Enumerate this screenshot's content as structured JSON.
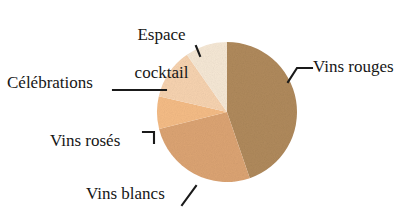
{
  "chart_data": {
    "type": "pie",
    "title": "",
    "subtitle": "",
    "xlabel": "",
    "ylabel": "",
    "grid": false,
    "legend_position": "none",
    "labels_position": "outside-with-leader-lines",
    "center": {
      "x": 227,
      "y": 112
    },
    "radius": 70,
    "start_angle_deg": 0,
    "direction": "clockwise",
    "categories": [
      "Vins rouges",
      "Vins blancs",
      "Vins rosés",
      "Célébrations",
      "Espace cocktail"
    ],
    "values": [
      44.7,
      26.4,
      7.5,
      11.7,
      9.7
    ],
    "value_unit": "percent",
    "slices": [
      {
        "label": "Vins rouges",
        "value": 44.7,
        "color": "#B08A5C",
        "start_deg": 0,
        "end_deg": 161
      },
      {
        "label": "Vins blancs",
        "value": 26.4,
        "color": "#DCA473",
        "start_deg": 161,
        "end_deg": 256
      },
      {
        "label": "Vins rosés",
        "value": 7.5,
        "color": "#F5BC86",
        "start_deg": 256,
        "end_deg": 283
      },
      {
        "label": "Célébrations",
        "value": 11.7,
        "color": "#F7D3B0",
        "start_deg": 283,
        "end_deg": 325
      },
      {
        "label": "Espace cocktail",
        "value": 9.7,
        "color": "#F6E8D5",
        "start_deg": 325,
        "end_deg": 360
      }
    ]
  },
  "labels": {
    "espace_cocktail_line1": "Espace",
    "espace_cocktail_line2": "cocktail",
    "celebrations": "Célébrations",
    "vins_roses": "Vins rosés",
    "vins_blancs": "Vins blancs",
    "vins_rouges": "Vins rouges"
  },
  "colors": {
    "background": "#FFFFFF",
    "text": "#161616",
    "leader_line": "#1A1A1A",
    "vins_rouges": "#B08A5C",
    "vins_blancs": "#DCA473",
    "vins_roses": "#F5BC86",
    "celebrations": "#F7D3B0",
    "espace_cocktail": "#F6E8D5"
  }
}
